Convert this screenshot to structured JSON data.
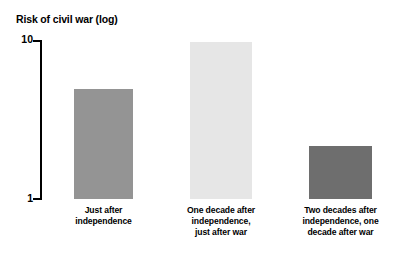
{
  "chart_data": {
    "type": "bar",
    "title": "Risk of civil war (log)",
    "xlabel": "",
    "ylabel": "Risk of civil war (log)",
    "scale": "log",
    "ylim": [
      1,
      10
    ],
    "ytick_labels": [
      "10",
      "1"
    ],
    "grid": false,
    "legend": "none",
    "categories": [
      "Just after independence",
      "One decade after independence, just after war",
      "Two decades after independence, one decade after war"
    ],
    "values": [
      4.9,
      9.7,
      2.2
    ],
    "bars": [
      {
        "label_lines": [
          "Just after",
          "independence"
        ],
        "value": 4.9,
        "color": "#949494",
        "left": 74,
        "width": 59,
        "top": 89,
        "height": 110,
        "label_left": 54,
        "label_width": 99
      },
      {
        "label_lines": [
          "One decade after",
          "independence,",
          "just after war"
        ],
        "value": 9.7,
        "color": "#e6e6e6",
        "left": 190,
        "width": 62,
        "top": 42,
        "height": 157,
        "label_left": 175,
        "label_width": 92
      },
      {
        "label_lines": [
          "Two decades after",
          "independence, one",
          "decade after war"
        ],
        "value": 2.2,
        "color": "#6e6e6e",
        "left": 309,
        "width": 63,
        "top": 146,
        "height": 53,
        "label_left": 292,
        "label_width": 97
      }
    ],
    "axis": {
      "top_label": "10",
      "bottom_label": "1",
      "line_color": "#000000"
    }
  }
}
